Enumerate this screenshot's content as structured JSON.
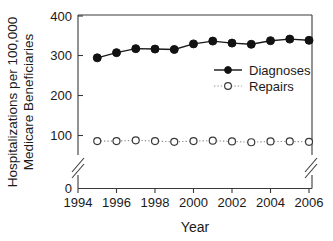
{
  "chart_data": {
    "type": "line",
    "title": "",
    "xlabel": "Year",
    "ylabel": "Hospitalizations per 100,000 Medicare Beneficiaries",
    "ylabel_line1": "Hospitalizations per 100,000",
    "ylabel_line2": "Medicare Beneficiaries",
    "x": [
      1995,
      1996,
      1997,
      1998,
      1999,
      2000,
      2001,
      2002,
      2003,
      2004,
      2005,
      2006
    ],
    "xlim": [
      1994,
      2006.6
    ],
    "ylim": [
      0,
      400
    ],
    "y_axis_break": true,
    "y_break_range": [
      10,
      70
    ],
    "grid": false,
    "xticks": [
      1994,
      1996,
      1998,
      2000,
      2002,
      2004,
      2006
    ],
    "xticklabels": [
      "1994",
      "1996",
      "1998",
      "2000",
      "2002",
      "2004",
      "2006"
    ],
    "yticks": [
      0,
      100,
      200,
      300,
      400
    ],
    "yticklabels": [
      "0",
      "100",
      "200",
      "300",
      "400"
    ],
    "legend_position": "center-right-inside",
    "series": [
      {
        "name": "Diagnoses",
        "marker": "filled-circle",
        "linestyle": "solid",
        "color": "#121212",
        "values": [
          295,
          308,
          318,
          317,
          316,
          330,
          337,
          332,
          329,
          338,
          342,
          339
        ]
      },
      {
        "name": "Repairs",
        "marker": "open-circle",
        "linestyle": "dotted",
        "color": "#3a3a3a",
        "values": [
          86,
          86,
          88,
          86,
          84,
          86,
          87,
          85,
          83,
          85,
          85,
          84
        ]
      }
    ]
  },
  "legend": {
    "items": [
      {
        "label": "Diagnoses"
      },
      {
        "label": "Repairs"
      }
    ]
  },
  "axes": {
    "x_title": "Year",
    "y_title_line1": "Hospitalizations per 100,000",
    "y_title_line2": "Medicare Beneficiaries"
  }
}
